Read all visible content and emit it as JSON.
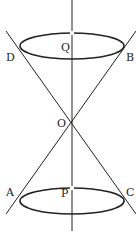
{
  "diagram": {
    "type": "double-cone",
    "colors": {
      "stroke": "#222222",
      "background": "#ffffff"
    },
    "axis": {
      "x": 72,
      "y1": 0,
      "y2": 231
    },
    "vertex": {
      "label": "O",
      "x": 72,
      "y": 118
    },
    "top_circle": {
      "center_label": "Q",
      "cx": 72,
      "cy": 46,
      "rx": 52,
      "ry": 13,
      "left_label": "D",
      "right_label": "B"
    },
    "bottom_circle": {
      "center_label": "P",
      "cx": 72,
      "cy": 201,
      "rx": 52,
      "ry": 13,
      "left_label": "A",
      "right_label": "C"
    },
    "lines": [
      {
        "name": "generator-DC",
        "x1": 6,
        "y1": 31,
        "x2": 136,
        "y2": 214
      },
      {
        "name": "generator-BA",
        "x1": 136,
        "y1": 31,
        "x2": 6,
        "y2": 214
      }
    ],
    "labels": {
      "D": "D",
      "Q": "Q",
      "B": "B",
      "O": "O",
      "A": "A",
      "P": "P",
      "C": "C"
    }
  }
}
